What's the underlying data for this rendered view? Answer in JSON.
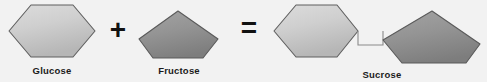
{
  "diagram": {
    "background_color": "#f2f2f2",
    "operators": {
      "plus": "+",
      "equals": "="
    },
    "labels": {
      "glucose": "Glucose",
      "fructose": "Fructose",
      "sucrose": "Sucrose"
    },
    "colors": {
      "hexagon_fill_light": "#d4d4d4",
      "hexagon_fill_dark": "#b4b4b4",
      "pentagon_fill_light": "#9b9b9b",
      "pentagon_fill_dark": "#808080",
      "shape_stroke": "#5a5a5a",
      "bond_stroke": "#777777",
      "label_color": "#1b1b1b",
      "operator_color": "#111111"
    },
    "shapes": [
      {
        "id": "glucose-hexagon",
        "kind": "hexagon",
        "molecule": "Glucose",
        "side": "reactant",
        "fill": "light-gray"
      },
      {
        "id": "fructose-pentagon",
        "kind": "pentagon",
        "molecule": "Fructose",
        "side": "reactant",
        "fill": "medium-gray"
      },
      {
        "id": "sucrose-hexagon",
        "kind": "hexagon",
        "molecule": "Glucose unit of Sucrose",
        "side": "product",
        "fill": "light-gray"
      },
      {
        "id": "sucrose-pentagon",
        "kind": "pentagon",
        "molecule": "Fructose unit of Sucrose",
        "side": "product",
        "fill": "medium-gray"
      }
    ],
    "bond": {
      "id": "glycosidic-bond",
      "description": "bracket link joining the hexagon and pentagon of sucrose"
    }
  }
}
